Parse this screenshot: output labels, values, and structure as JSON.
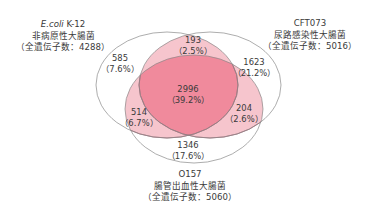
{
  "colors": {
    "outline": "#8a8a8a",
    "inner_edge": "#a06070",
    "pair_fill": "#f6c5cd",
    "triple_fill": "#f08a9c",
    "text": "#3a3a3a"
  },
  "sets": {
    "k12": {
      "name_italic": "E.coli",
      "name_rest": " K-12",
      "description": "非病原性大腸菌",
      "total": "（全遺伝子数：4288）"
    },
    "cft073": {
      "name": "CFT073",
      "description": "尿路感染性大腸菌",
      "total": "（全遺伝子数：5016）"
    },
    "o157": {
      "name": "O157",
      "description": "腸管出血性大腸菌",
      "total": "（全遺伝子数：5060）"
    }
  },
  "regions": {
    "k12_only": {
      "count": "585",
      "pct": "（7.6%）"
    },
    "k12_cft073": {
      "count": "193",
      "pct": "（2.5%）"
    },
    "cft073_only": {
      "count": "1623",
      "pct": "（21.2%）"
    },
    "all_three": {
      "count": "2996",
      "pct": "（39.2%）"
    },
    "k12_o157": {
      "count": "514",
      "pct": "（6.7%）"
    },
    "cft073_o157": {
      "count": "204",
      "pct": "（2.6%）"
    },
    "o157_only": {
      "count": "1346",
      "pct": "（17.6%）"
    }
  }
}
